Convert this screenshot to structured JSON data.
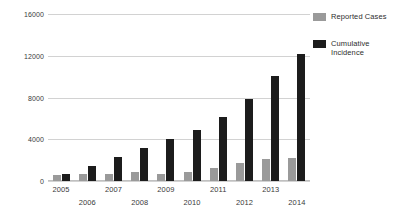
{
  "chart_data": {
    "type": "bar",
    "title": "",
    "xlabel": "",
    "ylabel": "",
    "ylim": [
      0,
      16000
    ],
    "yticks": [
      0,
      4000,
      8000,
      12000,
      16000
    ],
    "ytick_labels": [
      "0",
      "4000",
      "8000",
      "12000",
      "16000"
    ],
    "grid": true,
    "legend_position": "right",
    "categories": [
      "2005",
      "2006",
      "2007",
      "2008",
      "2009",
      "2010",
      "2011",
      "2012",
      "2013",
      "2014"
    ],
    "series": [
      {
        "name": "Reported Cases",
        "color": "#9a9a9a",
        "values": [
          570,
          640,
          720,
          850,
          700,
          820,
          1230,
          1750,
          2080,
          2250
        ]
      },
      {
        "name": "Cumulative Incidence",
        "color": "#1c1c1c",
        "values": [
          660,
          1430,
          2300,
          3200,
          4050,
          4880,
          6100,
          7880,
          10050,
          12200
        ]
      }
    ]
  },
  "legend": {
    "entries": [
      {
        "label": "Reported Cases",
        "swatch": "legend-swatch-reported"
      },
      {
        "label": "Cumulative Incidence",
        "swatch": "legend-swatch-cumulative"
      }
    ]
  }
}
